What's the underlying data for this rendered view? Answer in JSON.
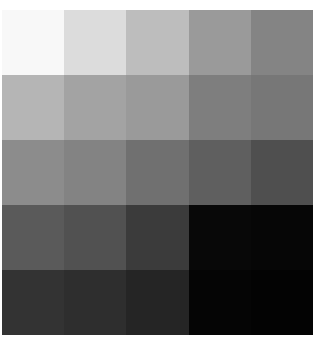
{
  "image": {
    "description": "5x5 grayscale patch grid, lightest at top-left, darkest at bottom-right",
    "rows": 5,
    "cols": 5,
    "cells": [
      [
        "#f8f8f8",
        "#dcdcdc",
        "#bdbdbd",
        "#9a9a9a",
        "#848484"
      ],
      [
        "#b5b5b5",
        "#a3a3a3",
        "#9a9a9a",
        "#7e7e7e",
        "#777777"
      ],
      [
        "#8c8c8c",
        "#838383",
        "#707070",
        "#5f5f5f",
        "#4f4f4f"
      ],
      [
        "#5a5a5a",
        "#515151",
        "#3b3b3b",
        "#080808",
        "#060606"
      ],
      [
        "#333333",
        "#2e2e2e",
        "#252525",
        "#050505",
        "#030303"
      ]
    ]
  }
}
